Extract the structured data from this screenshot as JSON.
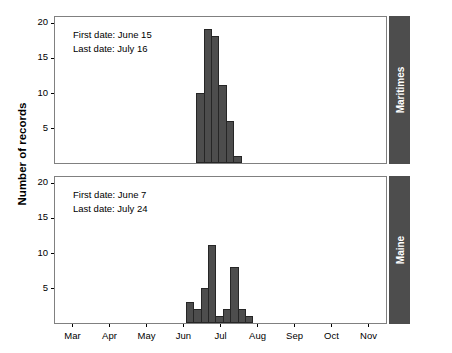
{
  "chart_data": {
    "type": "bar",
    "title": "",
    "subtitle": "",
    "xlabel": "",
    "ylabel": "Number of records",
    "grid": false,
    "legend": false,
    "xlim": [
      0,
      9
    ],
    "ylim": [
      0,
      21
    ],
    "x_tick_labels": [
      "Mar",
      "Apr",
      "May",
      "Jun",
      "Jul",
      "Aug",
      "Sep",
      "Oct",
      "Nov"
    ],
    "x_tick_positions": [
      0.5,
      1.5,
      2.5,
      3.5,
      4.5,
      5.5,
      6.5,
      7.5,
      8.5
    ],
    "y_tick_labels": [
      "5",
      "10",
      "15",
      "20"
    ],
    "y_tick_values": [
      5,
      10,
      15,
      20
    ],
    "facet_orientation": "vertical-stacked",
    "bin_width_weeks": 1,
    "panels": [
      {
        "strip_label": "Maritimes",
        "annotations": [
          "First date: June 15",
          "Last date: July 16"
        ],
        "first_date": "June 15",
        "last_date": "July 16",
        "bars": [
          {
            "x": 3.93,
            "value": 10
          },
          {
            "x": 4.13,
            "value": 19
          },
          {
            "x": 4.33,
            "value": 18
          },
          {
            "x": 4.53,
            "value": 11
          },
          {
            "x": 4.73,
            "value": 6
          },
          {
            "x": 4.93,
            "value": 1
          }
        ],
        "values": [
          10,
          19,
          18,
          11,
          6,
          1
        ],
        "total_records": 65
      },
      {
        "strip_label": "Maine",
        "annotations": [
          "First date: June 7",
          "Last date: July 24"
        ],
        "first_date": "June 7",
        "last_date": "July 24",
        "bars": [
          {
            "x": 3.65,
            "value": 3
          },
          {
            "x": 3.85,
            "value": 2
          },
          {
            "x": 4.05,
            "value": 5
          },
          {
            "x": 4.25,
            "value": 11
          },
          {
            "x": 4.45,
            "value": 1
          },
          {
            "x": 4.65,
            "value": 2
          },
          {
            "x": 4.85,
            "value": 8
          },
          {
            "x": 5.05,
            "value": 2
          },
          {
            "x": 5.25,
            "value": 1
          }
        ],
        "values": [
          3,
          2,
          5,
          11,
          1,
          2,
          8,
          2,
          1
        ],
        "total_records": 35
      }
    ],
    "colors": {
      "bar_fill": "#4d4d4d",
      "bar_border": "#262626",
      "strip_background": "#4d4d4d",
      "strip_text": "#ffffff",
      "panel_border": "#808080",
      "axis_text": "#000000",
      "background": "#ffffff"
    }
  }
}
